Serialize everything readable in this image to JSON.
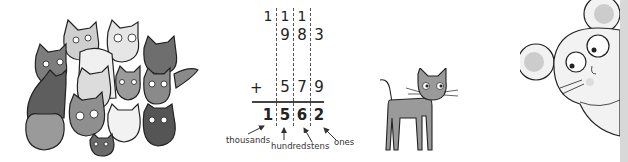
{
  "addition": {
    "carries": [
      "1",
      "1",
      "1"
    ],
    "addend1": [
      "9",
      "8",
      "3"
    ],
    "operator": "+",
    "addend2": [
      "5",
      "7",
      "9"
    ],
    "sum": [
      "1",
      "5",
      "6",
      "2"
    ],
    "place_labels": {
      "thousands": "thousands",
      "hundreds": "hundreds",
      "tens": "tens",
      "ones": "ones"
    }
  },
  "illustrations": {
    "cats_group": "group-of-cats",
    "lone_cat": "gray-cat",
    "mouse": "peeking-mouse"
  },
  "colors": {
    "cat_dark": "#6e6e6e",
    "cat_mid": "#9a9a9a",
    "cat_light": "#cfcfcf",
    "cat_white": "#eeeeee",
    "mouse_face": "#f2f2f2",
    "mouse_ear_inner": "#cccccc",
    "edge_strip": "#d8d8d8",
    "text": "#222222"
  }
}
